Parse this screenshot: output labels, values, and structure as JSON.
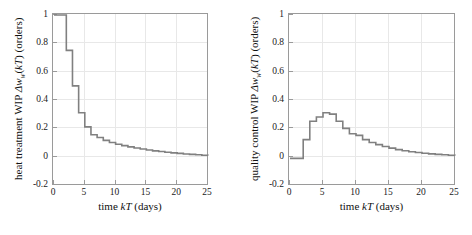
{
  "figure": {
    "background": "#ffffff",
    "curve_color": "#808080",
    "axis_color": "#9a9a9a",
    "grid_color": "#e8e8e8"
  },
  "panels": [
    {
      "id": "heat-treatment",
      "ylabel_prefix": "heat treatment WIP ",
      "ylabel_symbol": "Δw",
      "ylabel_subscript": "w",
      "ylabel_arg_open": "(",
      "ylabel_arg_kT": "kT",
      "ylabel_arg_close": ")",
      "ylabel_units": " (orders)",
      "xlabel_prefix": "time ",
      "xlabel_symbol": "kT",
      "xlabel_units": " (days)",
      "xticks": [
        0,
        5,
        10,
        15,
        20,
        25
      ],
      "yticks": [
        1,
        0.8,
        0.6,
        0.4,
        0.2,
        0,
        -0.2
      ],
      "ytick_labels": [
        "1",
        "0.8",
        "0.6",
        "0.4",
        "0.2",
        "0",
        "-0.2"
      ],
      "xtick_labels": [
        "0",
        "5",
        "10",
        "15",
        "20",
        "25"
      ]
    },
    {
      "id": "quality-control",
      "ylabel_prefix": "quality control WIP ",
      "ylabel_symbol": "Δw",
      "ylabel_subscript": "w",
      "ylabel_arg_open": "(",
      "ylabel_arg_kT": "kT",
      "ylabel_arg_close": ")",
      "ylabel_units": " (orders)",
      "xlabel_prefix": "time ",
      "xlabel_symbol": "kT",
      "xlabel_units": " (days)",
      "xticks": [
        0,
        5,
        10,
        15,
        20,
        25
      ],
      "yticks": [
        1,
        0.8,
        0.6,
        0.4,
        0.2,
        0,
        -0.2
      ],
      "ytick_labels": [
        "1",
        "0.8",
        "0.6",
        "0.4",
        "0.2",
        "0",
        "-0.2"
      ],
      "xtick_labels": [
        "0",
        "5",
        "10",
        "15",
        "20",
        "25"
      ]
    }
  ],
  "chart_data": [
    {
      "type": "line",
      "id": "heat-treatment-wip",
      "style": "step-post",
      "title": "",
      "xlabel": "time kT (days)",
      "ylabel": "heat treatment WIP Δw_w(kT) (orders)",
      "xlim": [
        0,
        25
      ],
      "ylim": [
        -0.2,
        1
      ],
      "grid": true,
      "legend": null,
      "x": [
        0,
        1,
        2,
        3,
        4,
        5,
        6,
        7,
        8,
        9,
        10,
        11,
        12,
        13,
        14,
        15,
        16,
        17,
        18,
        19,
        20,
        21,
        22,
        23,
        24,
        25
      ],
      "y": [
        1.0,
        1.0,
        0.75,
        0.5,
        0.31,
        0.21,
        0.155,
        0.135,
        0.115,
        0.1,
        0.088,
        0.078,
        0.069,
        0.061,
        0.054,
        0.047,
        0.041,
        0.036,
        0.031,
        0.027,
        0.023,
        0.019,
        0.016,
        0.013,
        0.01,
        0.008
      ]
    },
    {
      "type": "line",
      "id": "quality-control-wip",
      "style": "step-post",
      "title": "",
      "xlabel": "time kT (days)",
      "ylabel": "quality control WIP Δw_w(kT) (orders)",
      "xlim": [
        0,
        25
      ],
      "ylim": [
        -0.2,
        1
      ],
      "grid": true,
      "legend": null,
      "x": [
        0,
        1,
        2,
        3,
        4,
        5,
        6,
        7,
        8,
        9,
        10,
        11,
        12,
        13,
        14,
        15,
        16,
        17,
        18,
        19,
        20,
        21,
        22,
        23,
        24,
        25
      ],
      "y": [
        -0.012,
        -0.012,
        0.12,
        0.25,
        0.28,
        0.31,
        0.3,
        0.25,
        0.2,
        0.162,
        0.15,
        0.12,
        0.1,
        0.085,
        0.072,
        0.06,
        0.05,
        0.042,
        0.035,
        0.029,
        0.024,
        0.02,
        0.016,
        0.013,
        0.01,
        0.008
      ]
    }
  ]
}
